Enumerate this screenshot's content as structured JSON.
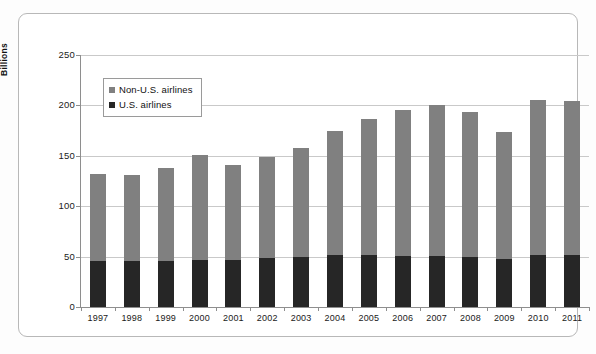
{
  "chart_data": {
    "type": "bar",
    "subtype": "stacked-column",
    "title": "",
    "xlabel": "",
    "ylabel": "Billions",
    "ylim": [
      0,
      250
    ],
    "yticks": [
      0,
      50,
      100,
      150,
      200,
      250
    ],
    "grid": true,
    "legend_position": "inside-top-left",
    "categories": [
      "1997",
      "1998",
      "1999",
      "2000",
      "2001",
      "2002",
      "2003",
      "2004",
      "2005",
      "2006",
      "2007",
      "2008",
      "2009",
      "2010",
      "2011"
    ],
    "series": [
      {
        "name": "U.S. airlines",
        "color": "#262626",
        "values": [
          46,
          46,
          46,
          47,
          47,
          49,
          50,
          52,
          52,
          51,
          51,
          50,
          48,
          52,
          52
        ]
      },
      {
        "name": "Non-U.S. airlines",
        "color": "#808080",
        "values": [
          86,
          85,
          92,
          104,
          94,
          100,
          108,
          123,
          135,
          144,
          149,
          143,
          126,
          153,
          152
        ]
      }
    ],
    "totals": [
      132,
      131,
      138,
      151,
      141,
      149,
      158,
      175,
      187,
      195,
      200,
      193,
      174,
      205,
      204
    ]
  },
  "legend": {
    "items": [
      {
        "label": "Non-U.S. airlines",
        "color": "#808080"
      },
      {
        "label": "U.S. airlines",
        "color": "#262626"
      }
    ]
  },
  "axis": {
    "y_title": "Billions",
    "y_tick_labels": [
      "250",
      "200",
      "150",
      "100",
      "50",
      "0"
    ]
  }
}
